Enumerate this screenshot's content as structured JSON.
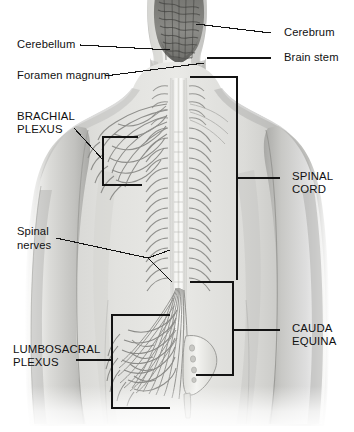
{
  "figure": {
    "background_color": "#ffffff",
    "ink_color": "#111111",
    "width": 354,
    "height": 432
  },
  "labels": {
    "cerebellum": "Cerebellum",
    "foramen_magnum": "Foramen magnum",
    "brachial_plexus_line1": "BRACHIAL",
    "brachial_plexus_line2": "PLEXUS",
    "spinal_nerves_line1": "Spinal",
    "spinal_nerves_line2": "nerves",
    "lumbosacral_plexus_line1": "LUMBOSACRAL",
    "lumbosacral_plexus_line2": "PLEXUS",
    "cerebrum": "Cerebrum",
    "brain_stem": "Brain stem",
    "spinal_cord_line1": "SPINAL",
    "spinal_cord_line2": "CORD",
    "cauda_equina_line1": "CAUDA",
    "cauda_equina_line2": "EQUINA"
  },
  "structures": {
    "brain": "cerebrum-and-cerebellum",
    "brain_stem": "brain-stem",
    "skull_base": "foramen-magnum",
    "torso": "human-back-torso",
    "vertebral_column": "vertebral-column",
    "spinal_cord": "spinal-cord",
    "brachial_plexus": "brachial-plexus-nerves",
    "lumbosacral_plexus": "lumbosacral-plexus-nerves",
    "cauda_equina": "cauda-equina-nerve-roots",
    "sacrum": "sacrum-bone"
  },
  "colors": {
    "ink": "#111111",
    "leader": "#1a1a1a",
    "skin_light": "#e6e6e4",
    "skin_mid": "#c9c9c6",
    "skin_shadow": "#a5a5a2",
    "brain_dark": "#6a6a68",
    "brain_mid": "#8e8e8b",
    "cord_light": "#f2f2f0",
    "nerve": "#9a9a97",
    "bone": "#efefec"
  }
}
